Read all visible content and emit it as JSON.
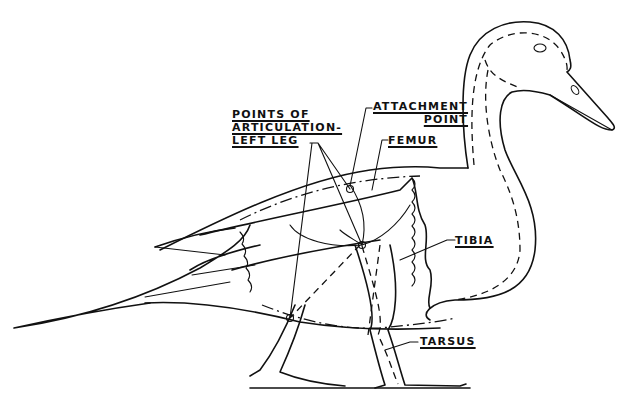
{
  "diagram": {
    "labels": {
      "points_of_articulation": [
        "POINTS OF",
        "ARTICULATION-",
        "LEFT LEG"
      ],
      "attachment_point": [
        "ATTACHMENT",
        "POINT"
      ],
      "femur": "FEMUR",
      "tibia": "TIBIA",
      "tarsus": "TARSUS"
    },
    "colors": {
      "ink": "#111111",
      "background": "#ffffff"
    }
  }
}
